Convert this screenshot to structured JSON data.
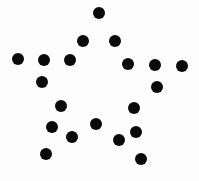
{
  "figure": {
    "background_color": "#fdfdfd",
    "dot_color": "#0a0a0a",
    "width": 199,
    "height": 181,
    "dot_count": 20,
    "dot_diameter": 12,
    "shape_name": "five-pointed star outline"
  },
  "chart_data": {
    "type": "scatter",
    "xlabel": "",
    "ylabel": "",
    "xlim": [
      0,
      199
    ],
    "ylim": [
      181,
      0
    ],
    "grid": false,
    "legend": false,
    "marker": "filled-circle",
    "marker_size": 12,
    "marker_color": "#0a0a0a",
    "series": [
      {
        "name": "star-outline-points",
        "points": [
          {
            "id": "p01",
            "label": "apex",
            "x": 99,
            "y": 13,
            "d": 12
          },
          {
            "id": "p02",
            "label": "upper-left-shoulder",
            "x": 83,
            "y": 41,
            "d": 12
          },
          {
            "id": "p03",
            "label": "upper-right-shoulder",
            "x": 115,
            "y": 41,
            "d": 12
          },
          {
            "id": "p04",
            "label": "left-arm-tip",
            "x": 18,
            "y": 59,
            "d": 12
          },
          {
            "id": "p05",
            "label": "left-arm-mid",
            "x": 44,
            "y": 60,
            "d": 12
          },
          {
            "id": "p06",
            "label": "left-arm-inner",
            "x": 70,
            "y": 60,
            "d": 12
          },
          {
            "id": "p07",
            "label": "right-arm-inner",
            "x": 128,
            "y": 64,
            "d": 12
          },
          {
            "id": "p08",
            "label": "right-arm-mid",
            "x": 155,
            "y": 65,
            "d": 12
          },
          {
            "id": "p09",
            "label": "right-arm-tip",
            "x": 182,
            "y": 66,
            "d": 12
          },
          {
            "id": "p10",
            "label": "left-upper-inner",
            "x": 42,
            "y": 82,
            "d": 12
          },
          {
            "id": "p11",
            "label": "right-upper-inner",
            "x": 157,
            "y": 87,
            "d": 12
          },
          {
            "id": "p12",
            "label": "left-mid-inner",
            "x": 61,
            "y": 106,
            "d": 12
          },
          {
            "id": "p13",
            "label": "right-mid-inner",
            "x": 134,
            "y": 108,
            "d": 12
          },
          {
            "id": "p14",
            "label": "center-notch",
            "x": 96,
            "y": 124,
            "d": 12
          },
          {
            "id": "p15",
            "label": "left-leg-upper",
            "x": 52,
            "y": 127,
            "d": 12
          },
          {
            "id": "p16",
            "label": "right-leg-upper",
            "x": 136,
            "y": 132,
            "d": 12
          },
          {
            "id": "p17",
            "label": "left-leg-mid",
            "x": 72,
            "y": 137,
            "d": 12
          },
          {
            "id": "p18",
            "label": "right-leg-mid",
            "x": 119,
            "y": 140,
            "d": 12
          },
          {
            "id": "p19",
            "label": "left-leg-tip",
            "x": 46,
            "y": 154,
            "d": 12
          },
          {
            "id": "p20",
            "label": "right-leg-tip",
            "x": 141,
            "y": 159,
            "d": 12
          }
        ]
      }
    ]
  }
}
